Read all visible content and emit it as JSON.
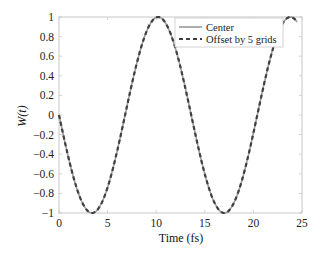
{
  "chart_data": {
    "type": "line",
    "title": "",
    "xlabel": "Time (fs)",
    "ylabel": "W(t)",
    "xlim": [
      0,
      25
    ],
    "ylim": [
      -1,
      1
    ],
    "xticks": [
      0,
      5,
      10,
      15,
      20,
      25
    ],
    "yticks": [
      -1,
      -0.8,
      -0.6,
      -0.4,
      -0.2,
      0,
      0.2,
      0.4,
      0.6,
      0.8,
      1
    ],
    "xtick_labels": [
      "0",
      "5",
      "10",
      "15",
      "20",
      "25"
    ],
    "ytick_labels": [
      "−1",
      "−0.8",
      "−0.6",
      "−0.4",
      "−0.2",
      "0",
      "0.2",
      "0.4",
      "0.6",
      "0.8",
      "1"
    ],
    "grid": false,
    "legend_position": "upper right",
    "x": [
      0,
      1,
      2,
      3,
      3.4,
      4,
      5,
      6,
      7,
      8,
      9,
      10,
      10.2,
      11,
      12,
      13,
      14,
      15,
      16,
      17,
      18,
      19,
      20,
      21,
      22,
      23,
      23.8,
      24.5
    ],
    "series": [
      {
        "name": "Center",
        "style": "solid",
        "color": "#9a9a9a",
        "values": [
          0,
          -0.44,
          -0.8,
          -0.99,
          -1.0,
          -0.95,
          -0.68,
          -0.27,
          0.18,
          0.6,
          0.9,
          1.0,
          1.0,
          0.94,
          0.7,
          0.31,
          -0.14,
          -0.56,
          -0.88,
          -1.0,
          -0.91,
          -0.62,
          -0.2,
          0.26,
          0.66,
          0.94,
          1.0,
          0.9
        ]
      },
      {
        "name": "Offset by 5 grids",
        "style": "dashed",
        "color": "#404040",
        "values": [
          0,
          -0.44,
          -0.8,
          -0.99,
          -1.0,
          -0.95,
          -0.68,
          -0.27,
          0.18,
          0.6,
          0.9,
          1.0,
          1.0,
          0.94,
          0.7,
          0.31,
          -0.14,
          -0.56,
          -0.88,
          -1.0,
          -0.91,
          -0.62,
          -0.2,
          0.26,
          0.66,
          0.94,
          1.0,
          0.9
        ]
      }
    ]
  },
  "legend": {
    "items": [
      {
        "label": "Center"
      },
      {
        "label": "Offset by 5 grids"
      }
    ]
  }
}
